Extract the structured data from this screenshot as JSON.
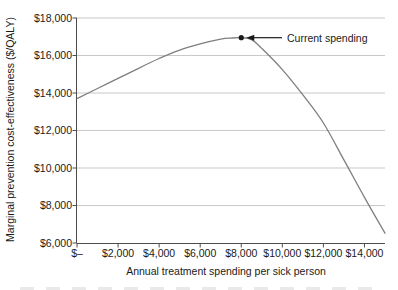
{
  "figure": {
    "xlabel": "Annual treatment spending per sick person",
    "ylabel": "Marginal prevention cost-effectiveness ($/QALY)",
    "annotation_label": "Current spending"
  },
  "colors": {
    "background": "#ffffff",
    "line": "#7f7f7f",
    "grid": "#c9c9c9",
    "axis": "#4d4d4d",
    "text": "#1a1a1a",
    "annotation": "#1a1a1a"
  },
  "chart_data": {
    "type": "line",
    "title": "",
    "xlabel": "Annual treatment spending per sick person",
    "ylabel": "Marginal prevention cost-effectiveness ($/QALY)",
    "xlim": [
      0,
      15000
    ],
    "ylim": [
      6000,
      18000
    ],
    "grid": "horizontal-only",
    "legend": "none",
    "x_ticks": {
      "values": [
        0,
        2000,
        4000,
        6000,
        8000,
        10000,
        12000,
        14000
      ],
      "labels": [
        "$–",
        "$2,000",
        "$4,000",
        "$6,000",
        "$8,000",
        "$10,000",
        "$12,000",
        "$14,000"
      ]
    },
    "y_ticks": {
      "values": [
        6000,
        8000,
        10000,
        12000,
        14000,
        16000,
        18000
      ],
      "labels": [
        "$6,000",
        "$8,000",
        "$10,000",
        "$12,000",
        "$14,000",
        "$16,000",
        "$18,000"
      ]
    },
    "series": [
      {
        "name": "Marginal prevention cost-effectiveness",
        "color": "#7f7f7f",
        "x": [
          0,
          1000,
          2000,
          3000,
          4000,
          5000,
          6000,
          7000,
          7500,
          8000,
          8500,
          9000,
          10000,
          11000,
          12000,
          13000,
          14000,
          15000
        ],
        "y": [
          13700,
          14240,
          14780,
          15320,
          15840,
          16290,
          16620,
          16870,
          16930,
          16950,
          16850,
          16380,
          15250,
          13900,
          12400,
          10430,
          8430,
          6520
        ]
      }
    ],
    "annotations": [
      {
        "text": "Current spending",
        "x": 8000,
        "y": 16950,
        "marker": "filled-dot",
        "arrow": "horizontal-left-pointing"
      }
    ]
  }
}
